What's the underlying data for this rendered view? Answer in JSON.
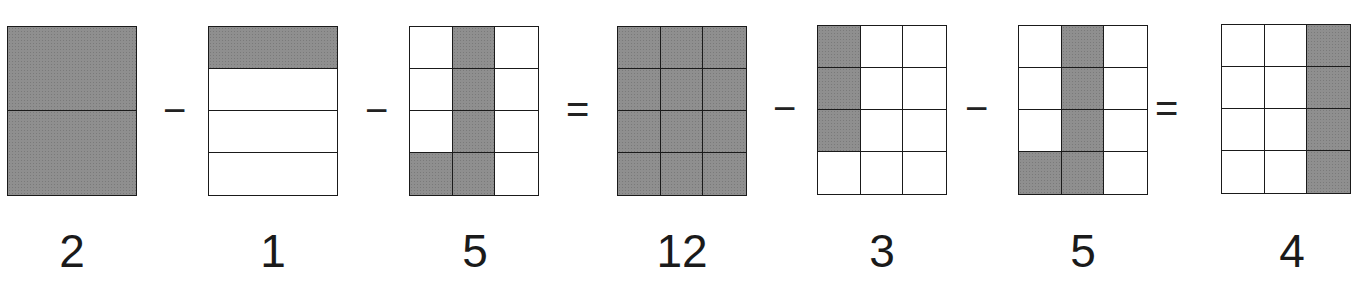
{
  "equation": {
    "operators": [
      "−",
      "−",
      "=",
      "−",
      "−",
      "="
    ],
    "figures": [
      {
        "label": "2",
        "rows": 2,
        "cols": 1,
        "shaded": [
          [
            1
          ],
          [
            1
          ]
        ]
      },
      {
        "label": "1",
        "rows": 4,
        "cols": 1,
        "shaded": [
          [
            1
          ],
          [
            0
          ],
          [
            0
          ],
          [
            0
          ]
        ]
      },
      {
        "label": "5",
        "rows": 4,
        "cols": 3,
        "shaded": [
          [
            0,
            1,
            0
          ],
          [
            0,
            1,
            0
          ],
          [
            0,
            1,
            0
          ],
          [
            1,
            1,
            0
          ]
        ]
      },
      {
        "label": "12",
        "rows": 4,
        "cols": 3,
        "shaded": [
          [
            1,
            1,
            1
          ],
          [
            1,
            1,
            1
          ],
          [
            1,
            1,
            1
          ],
          [
            1,
            1,
            1
          ]
        ]
      },
      {
        "label": "3",
        "rows": 4,
        "cols": 3,
        "shaded": [
          [
            1,
            0,
            0
          ],
          [
            1,
            0,
            0
          ],
          [
            1,
            0,
            0
          ],
          [
            0,
            0,
            0
          ]
        ]
      },
      {
        "label": "5",
        "rows": 4,
        "cols": 3,
        "shaded": [
          [
            0,
            1,
            0
          ],
          [
            0,
            1,
            0
          ],
          [
            0,
            1,
            0
          ],
          [
            1,
            1,
            0
          ]
        ]
      },
      {
        "label": "4",
        "rows": 4,
        "cols": 3,
        "shaded": [
          [
            0,
            0,
            1
          ],
          [
            0,
            0,
            1
          ],
          [
            0,
            0,
            1
          ],
          [
            0,
            0,
            1
          ]
        ]
      }
    ]
  },
  "colors": {
    "shade": "#8f8f8f",
    "line": "#1a1a1a",
    "background": "#ffffff"
  }
}
